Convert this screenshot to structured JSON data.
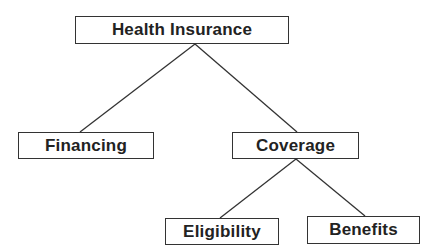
{
  "diagram": {
    "type": "tree",
    "root": "health_insurance",
    "nodes": [
      {
        "id": "health_insurance",
        "label": "Health Insurance",
        "box": {
          "x": 75,
          "y": 16,
          "w": 214,
          "h": 28
        }
      },
      {
        "id": "financing",
        "label": "Financing",
        "box": {
          "x": 18,
          "y": 132,
          "w": 136,
          "h": 27
        }
      },
      {
        "id": "coverage",
        "label": "Coverage",
        "box": {
          "x": 232,
          "y": 132,
          "w": 127,
          "h": 27
        }
      },
      {
        "id": "eligibility",
        "label": "Eligibility",
        "box": {
          "x": 165,
          "y": 218,
          "w": 114,
          "h": 27
        }
      },
      {
        "id": "benefits",
        "label": "Benefits",
        "box": {
          "x": 307,
          "y": 216,
          "w": 113,
          "h": 28
        }
      }
    ],
    "edges": [
      {
        "from": "health_insurance",
        "to": "financing",
        "x1": 195,
        "y1": 44,
        "x2": 80,
        "y2": 132
      },
      {
        "from": "health_insurance",
        "to": "coverage",
        "x1": 195,
        "y1": 44,
        "x2": 297,
        "y2": 132
      },
      {
        "from": "coverage",
        "to": "eligibility",
        "x1": 296,
        "y1": 159,
        "x2": 220,
        "y2": 218
      },
      {
        "from": "coverage",
        "to": "benefits",
        "x1": 296,
        "y1": 159,
        "x2": 365,
        "y2": 216
      }
    ],
    "colors": {
      "stroke": "#333333",
      "text": "#222222",
      "background": "#ffffff"
    }
  }
}
